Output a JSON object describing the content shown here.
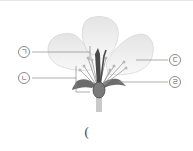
{
  "diagram": {
    "labels": [
      {
        "id": "a",
        "text": "ㄱ",
        "target": "pistil (stigma/style)"
      },
      {
        "id": "b",
        "text": "ㄴ",
        "target": "stamen"
      },
      {
        "id": "c",
        "text": "ㄷ",
        "target": "petal"
      },
      {
        "id": "d",
        "text": "ㄹ",
        "target": "sepal"
      }
    ],
    "answer_blank": "("
  }
}
